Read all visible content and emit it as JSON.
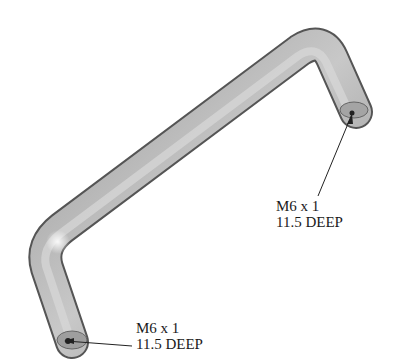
{
  "figure": {
    "colors": {
      "tube_dark": "#5a5a5a",
      "tube_mid": "#a8a8a8",
      "tube_light": "#e4e4e4",
      "ink": "#1a1a1a"
    }
  },
  "annotations": [
    {
      "id": "right-end",
      "thread": "M6 x 1",
      "depth": "11.5 DEEP"
    },
    {
      "id": "left-end",
      "thread": "M6 x 1",
      "depth": "11.5 DEEP"
    }
  ]
}
